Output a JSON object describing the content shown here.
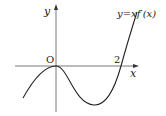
{
  "diagram": {
    "type": "function-graph",
    "curve_label": "y=xf′(x)",
    "axis_labels": {
      "x": "x",
      "y": "y"
    },
    "origin_label": "O",
    "tick_labels": [
      {
        "value": 2,
        "text": "2"
      }
    ],
    "curve": {
      "description": "Cubic-like graph of y = x f'(x): touches x-axis at origin (local max at x=0), dips to a local minimum between 0 and 2, crosses x-axis at x=2 and rises steeply.",
      "roots": [
        0,
        2
      ],
      "color": "#222222"
    },
    "axis_color": "#444444"
  }
}
